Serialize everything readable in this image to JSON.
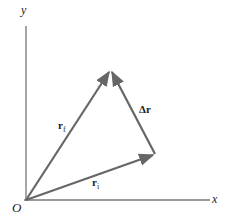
{
  "diagram": {
    "title": "",
    "axes": {
      "x_label": "x",
      "y_label": "y",
      "origin_label": "O"
    },
    "vectors": [
      {
        "id": "r_i",
        "label_main": "r",
        "label_sub": "i",
        "from": "O",
        "to": "P_i"
      },
      {
        "id": "r_f",
        "label_main": "r",
        "label_sub": "f",
        "from": "O",
        "to": "P_f"
      },
      {
        "id": "delta_r",
        "label_main": "Δr",
        "label_sub": "",
        "from": "P_i",
        "to": "P_f"
      }
    ],
    "colors": {
      "axis": "#777777",
      "vector": "#666666",
      "text": "#222222",
      "background": "#ffffff"
    }
  }
}
